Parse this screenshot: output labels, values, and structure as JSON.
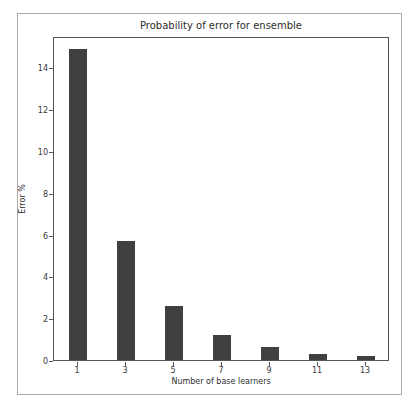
{
  "figure": {
    "title": "Probability of error for ensemble",
    "xlabel": "Number of base learners",
    "ylabel": "Error %"
  },
  "chart_data": {
    "type": "bar",
    "title": "Probability of error for ensemble",
    "xlabel": "Number of base learners",
    "ylabel": "Error %",
    "categories": [
      "1",
      "3",
      "5",
      "7",
      "9",
      "11",
      "13"
    ],
    "values": [
      14.9,
      5.7,
      2.6,
      1.2,
      0.6,
      0.3,
      0.2
    ],
    "yticks": [
      0,
      2,
      4,
      6,
      8,
      10,
      12,
      14
    ],
    "ylim": [
      0,
      15.5
    ],
    "grid": false,
    "legend": null,
    "bar_color": "#404040",
    "spine_color": "#565656",
    "outer_border_color": "#a9a9a9"
  }
}
